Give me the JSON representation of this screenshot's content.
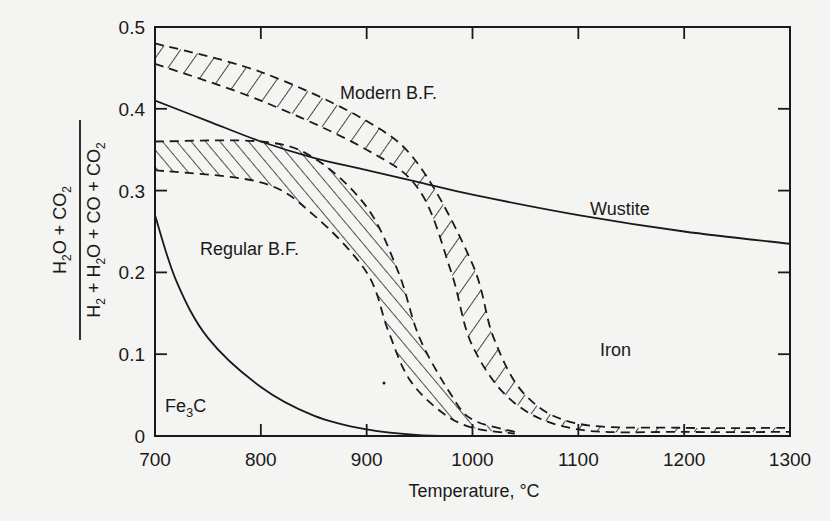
{
  "chart_data": {
    "type": "line",
    "title": "",
    "xlabel": "Temperature, °C",
    "ylabel": "(H2O + CO2) / (H2 + H2O + CO + CO2)",
    "ylabel_numerator": "H2O + CO2",
    "ylabel_denominator": "H2 + H2O + CO + CO2",
    "xlim": [
      700,
      1300
    ],
    "ylim": [
      0,
      0.5
    ],
    "x_ticks": [
      700,
      800,
      900,
      1000,
      1100,
      1200,
      1300
    ],
    "x_tick_labels": [
      "700",
      "800",
      "900",
      "1000",
      "1100",
      "1200",
      "1300"
    ],
    "y_ticks": [
      0,
      0.1,
      0.2,
      0.3,
      0.4,
      0.5
    ],
    "y_tick_labels": [
      "0",
      "0.1",
      "0.2",
      "0.3",
      "0.4",
      "0.5"
    ],
    "grid": false,
    "legend": "none",
    "region_labels": [
      "Modern B.F.",
      "Regular B.F.",
      "Wustite",
      "Iron",
      "Fe3C"
    ],
    "series": [
      {
        "name": "Wustite/Iron boundary",
        "style": "solid",
        "x": [
          700,
          750,
          800,
          850,
          900,
          950,
          1000,
          1100,
          1200,
          1300
        ],
        "y": [
          0.41,
          0.385,
          0.36,
          0.34,
          0.325,
          0.31,
          0.295,
          0.27,
          0.25,
          0.235
        ]
      },
      {
        "name": "Fe3C boundary",
        "style": "solid",
        "x": [
          700,
          720,
          750,
          800,
          850,
          900,
          950,
          1000
        ],
        "y": [
          0.27,
          0.19,
          0.12,
          0.06,
          0.025,
          0.008,
          0.001,
          0
        ]
      },
      {
        "name": "Modern B.F. band upper",
        "style": "dashed-hatched",
        "x": [
          700,
          800,
          900,
          950,
          1000,
          1020,
          1050,
          1100,
          1200,
          1300
        ],
        "y": [
          0.48,
          0.445,
          0.385,
          0.33,
          0.21,
          0.12,
          0.05,
          0.015,
          0.01,
          0.01
        ]
      },
      {
        "name": "Modern B.F. band lower",
        "style": "dashed-hatched",
        "x": [
          700,
          800,
          900,
          950,
          980,
          1000,
          1040,
          1100,
          1200,
          1300
        ],
        "y": [
          0.455,
          0.41,
          0.35,
          0.3,
          0.2,
          0.11,
          0.04,
          0.008,
          0.005,
          0.005
        ]
      },
      {
        "name": "Regular B.F. band upper",
        "style": "dashed-hatched",
        "x": [
          700,
          800,
          850,
          900,
          930,
          950,
          980,
          1000,
          1040
        ],
        "y": [
          0.36,
          0.36,
          0.34,
          0.28,
          0.2,
          0.12,
          0.05,
          0.02,
          0.005
        ]
      },
      {
        "name": "Regular B.F. band lower",
        "style": "dashed-hatched",
        "x": [
          700,
          800,
          850,
          900,
          920,
          940,
          970,
          1000,
          1040
        ],
        "y": [
          0.325,
          0.31,
          0.27,
          0.2,
          0.13,
          0.07,
          0.03,
          0.01,
          0.003
        ]
      }
    ]
  }
}
